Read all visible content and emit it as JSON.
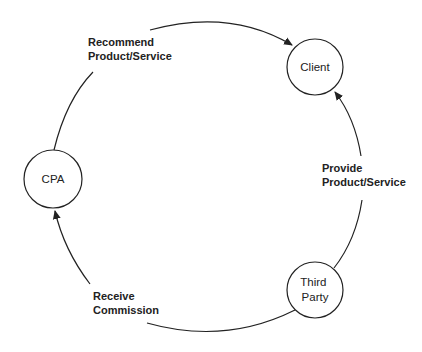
{
  "diagram": {
    "type": "cycle",
    "nodes": [
      {
        "id": "client",
        "label_lines": [
          "Client"
        ],
        "cx": 315,
        "cy": 67,
        "r": 28
      },
      {
        "id": "cpa",
        "label_lines": [
          "CPA"
        ],
        "cx": 53,
        "cy": 179,
        "r": 29
      },
      {
        "id": "third-party",
        "label_lines": [
          "Third",
          "Party"
        ],
        "cx": 315,
        "cy": 290,
        "r": 28
      }
    ],
    "edges": [
      {
        "from": "cpa",
        "to": "client",
        "label_lines": [
          "Recommend",
          "Product/Service"
        ]
      },
      {
        "from": "third-party",
        "to": "client",
        "label_lines": [
          "Provide",
          "Product/Service"
        ]
      },
      {
        "from": "third-party",
        "to": "cpa",
        "label_lines": [
          "Receive",
          "Commission"
        ]
      }
    ],
    "colors": {
      "stroke": "#222222",
      "background": "#ffffff",
      "text": "#222222"
    }
  }
}
